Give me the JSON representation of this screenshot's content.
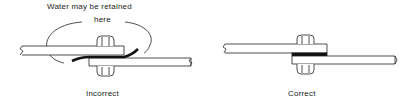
{
  "diagrams": [
    {
      "id": "incorrect",
      "caption": "Incorrect",
      "annotation_line1": "Water may be retained",
      "annotation_line2": "here"
    },
    {
      "id": "correct",
      "caption": "Correct"
    }
  ],
  "colors": {
    "line": "#222222",
    "background": "#ffffff"
  }
}
